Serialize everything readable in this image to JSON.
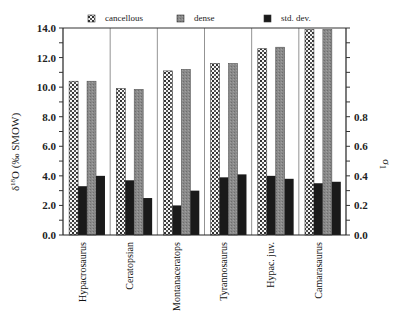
{
  "chart_data": {
    "type": "bar",
    "title": "",
    "categories": [
      "Hypacrosaurus",
      "Ceratopsian",
      "Montanaceratops",
      "Tyrannosaurus",
      "Hypac. juv.",
      "Camarasaurus"
    ],
    "series": [
      {
        "name": "cancellous",
        "axis": "left",
        "values": [
          10.4,
          9.9,
          11.1,
          11.6,
          12.6,
          13.9
        ]
      },
      {
        "name": "dense",
        "axis": "left",
        "values": [
          10.4,
          9.85,
          11.2,
          11.6,
          12.7,
          13.9
        ]
      },
      {
        "name": "std. dev. (cancellous)",
        "axis": "right",
        "values": [
          0.33,
          0.37,
          0.2,
          0.39,
          0.4,
          0.35
        ]
      },
      {
        "name": "std. dev. (dense)",
        "axis": "right",
        "values": [
          0.4,
          0.25,
          0.3,
          0.41,
          0.38,
          0.36
        ]
      }
    ],
    "legend": [
      "cancellous",
      "dense",
      "std. dev."
    ],
    "legend_position": "top",
    "xlabel": "",
    "ylabel": "δ18O (‰ SMOW)",
    "ylabel_right": "σ1",
    "ylim": [
      0,
      14
    ],
    "ylim_right": [
      0,
      1.4
    ],
    "yticks": [
      "0.0",
      "2.0",
      "4.0",
      "6.0",
      "8.0",
      "10.0",
      "12.0",
      "14.0"
    ],
    "yticks_right": [
      "0.0",
      "0.2",
      "0.4",
      "0.6",
      "0.8"
    ],
    "grid": false,
    "group_separators": true
  },
  "legend": {
    "cancellous": "cancellous",
    "dense": "dense",
    "stddev": "std. dev."
  },
  "axes": {
    "left_title": "δ18O (‰ SMOW)",
    "right_title": "σ1"
  }
}
